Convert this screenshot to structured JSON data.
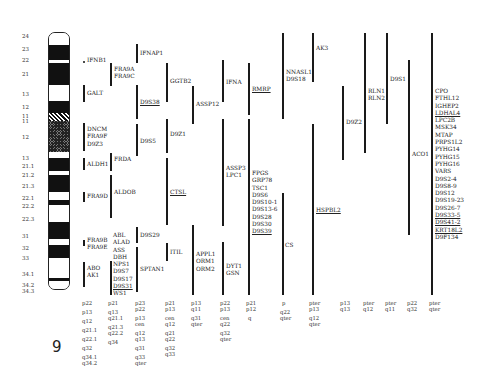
{
  "chromosome": {
    "number": "9",
    "band_labels": [
      "24",
      "23",
      "22",
      "21",
      "13",
      "12",
      "11",
      "11",
      "12",
      "13",
      "21.1",
      "21.2",
      "21.3",
      "22.1",
      "22.2",
      "22.3",
      "31",
      "32",
      "33",
      "34.1",
      "34.2",
      "34.3"
    ]
  },
  "columns": [
    {
      "id": "c1",
      "genes": [
        {
          "label": "IFNB1",
          "marker": "dot"
        },
        {
          "label": "GALT"
        },
        {
          "lines": [
            "DNCM",
            "FRA9F",
            "D9Z3"
          ]
        },
        {
          "label": "ALDH1"
        },
        {
          "label": "FRA9D"
        },
        {
          "lines": [
            "FRA9B",
            "FRA9E"
          ]
        },
        {
          "lines": [
            "ABO",
            "AK1"
          ]
        }
      ],
      "loc": [
        "p22",
        "",
        "p13",
        "",
        "q12",
        "",
        "q21.1",
        "",
        "q22.1",
        "",
        "q32",
        "",
        "q34.1",
        "q34.2"
      ]
    },
    {
      "id": "c2",
      "genes": [
        {
          "lines": [
            "FRA9A",
            "FRA9C"
          ]
        },
        {
          "label": "FRDA"
        },
        {
          "label": "ALDOB"
        },
        {
          "lines": [
            "ABL",
            "ALAD",
            "ASS",
            "DBH"
          ]
        },
        {
          "lines": [
            "NPS1",
            "D9S7",
            "D9S17",
            "D9S31",
            "WS1"
          ],
          "underlined": [
            "D9S31"
          ]
        }
      ],
      "loc": [
        "p21",
        "",
        "q13",
        "q21.1",
        "",
        "q21.3",
        "q22.2",
        "",
        "q34"
      ]
    },
    {
      "id": "c3",
      "genes": [
        {
          "label": "IFNAP1"
        },
        {
          "label": "D9S38",
          "underline": true
        },
        {
          "label": "D9S5"
        },
        {
          "label": "D9S29"
        },
        {
          "label": "SPTAN1"
        }
      ],
      "loc": [
        "p23",
        "p22",
        "",
        "p13",
        "cen",
        "",
        "q12",
        "q13",
        "",
        "q31",
        "",
        "q33",
        "qter"
      ]
    },
    {
      "id": "c4",
      "genes": [
        {
          "label": "GGTB2"
        },
        {
          "label": "D9Z1"
        },
        {
          "label": "CTSL",
          "underline": true
        },
        {
          "label": "ITIL"
        }
      ],
      "loc": [
        "p21",
        "p13",
        "",
        "cen",
        "q12",
        "",
        "q21",
        "q22",
        "",
        "q32",
        "q33"
      ]
    },
    {
      "id": "c5",
      "genes": [
        {
          "label": "ASSP12"
        },
        {
          "lines": [
            "APPL1",
            "ORM1",
            "ORM2"
          ]
        }
      ],
      "loc": [
        "p13",
        "q11",
        "",
        "q31",
        "qter"
      ]
    },
    {
      "id": "c6",
      "genes": [
        {
          "label": "IFNA"
        },
        {
          "lines": [
            "ASSP3",
            "LPC1"
          ]
        },
        {
          "lines": [
            "DYT1",
            "GSN"
          ]
        }
      ],
      "loc": [
        "p22",
        "p13",
        "",
        "cen",
        "q22",
        "",
        "q32",
        "qter"
      ]
    },
    {
      "id": "c7",
      "genes": [
        {
          "label": "RMRP",
          "underline": true
        },
        {
          "lines": [
            "FPGS",
            "GRP78",
            "TSC1",
            "D9S6",
            "D9S10-1",
            "D9S13-6",
            "D9S28",
            "D9S30",
            "D9S39"
          ],
          "underlined": [
            "D9S39"
          ]
        }
      ],
      "loc": [
        "p21",
        "p12",
        "",
        "q"
      ]
    },
    {
      "id": "c8",
      "genes": [
        {
          "lines": [
            "NNASL1",
            "D9S18"
          ]
        },
        {
          "label": "CS"
        }
      ],
      "loc": [
        "p",
        "",
        "q22",
        "qter"
      ]
    },
    {
      "id": "c9",
      "genes": [
        {
          "label": "AK3"
        },
        {
          "label": "HSPBL2",
          "underline": true
        }
      ],
      "loc": [
        "pter",
        "p13",
        "",
        "q12",
        "qter"
      ]
    },
    {
      "id": "c10",
      "genes": [
        {
          "label": "D9Z2"
        }
      ],
      "loc": [
        "p13",
        "q13"
      ]
    },
    {
      "id": "c11",
      "genes": [
        {
          "lines": [
            "RLN1",
            "RLN2"
          ]
        }
      ],
      "loc": [
        "pter",
        "q12"
      ]
    },
    {
      "id": "c12",
      "genes": [
        {
          "label": "D9S1"
        }
      ],
      "loc": [
        "pter",
        "q11"
      ]
    },
    {
      "id": "c13",
      "genes": [
        {
          "label": "ACO1"
        }
      ],
      "loc": [
        "p22",
        "q32"
      ]
    },
    {
      "id": "c14",
      "genes": [
        {
          "lines": [
            "CPO",
            "FTHL12",
            "IGHEP2",
            "LDHAL4",
            "LPC2B",
            "MSK34",
            "MTAP",
            "PRPS1L2",
            "PYHG14",
            "PYHG15",
            "PYHG16",
            "VARS",
            "D9S2-4",
            "D9S8-9",
            "D9S12",
            "D9S19-23",
            "D9S26-7",
            "D9S33-5",
            "D9S41-2",
            "KRT18L2",
            "D9F134"
          ],
          "underlined": [
            "LDHAL4",
            "D9S33-5",
            "D9S41-2",
            "KRT18L2"
          ]
        }
      ],
      "loc": [
        "pter",
        "qter"
      ]
    }
  ]
}
